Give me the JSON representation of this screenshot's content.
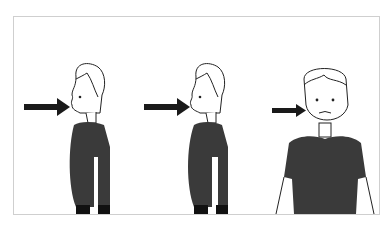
{
  "illustration": {
    "panels": [
      {
        "name": "neutral-profile",
        "arrow_target": "mouth"
      },
      {
        "name": "lips-pursed-profile",
        "arrow_target": "mouth"
      },
      {
        "name": "front-cheek",
        "arrow_target": "cheek"
      }
    ],
    "colors": {
      "shirt": "#3a3a3a",
      "outline": "#222222",
      "frame": "#cfcfcf",
      "arrow": "#1a1a1a"
    }
  }
}
